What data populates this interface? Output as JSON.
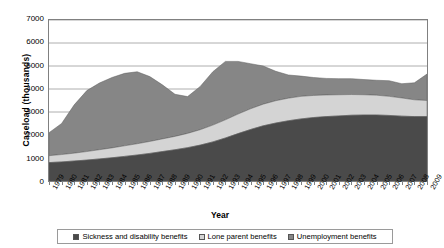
{
  "chart_data": {
    "type": "area",
    "stacked": true,
    "title": "",
    "xlabel": "Year",
    "ylabel": "Caseload (thousands)",
    "ylim": [
      0,
      7000
    ],
    "ytick_step": 1000,
    "yticks": [
      "7000",
      "6000",
      "5000",
      "4000",
      "3000",
      "2000",
      "1000",
      "0"
    ],
    "grid": true,
    "grid_axis": "y",
    "legend_position": "bottom",
    "categories": [
      "1979",
      "1980",
      "1981",
      "1982",
      "1983",
      "1984",
      "1985",
      "1986",
      "1987",
      "1988",
      "1989",
      "1990",
      "1991",
      "1992",
      "1993",
      "1994",
      "1995",
      "1996",
      "1997",
      "1998",
      "1999",
      "2000",
      "2001",
      "2002",
      "2003",
      "2004",
      "2005",
      "2006",
      "2007",
      "2008",
      "2009"
    ],
    "series": [
      {
        "name": "Sickness and disability benefits",
        "color": "#4a4a4a",
        "values": [
          800,
          830,
          870,
          910,
          960,
          1010,
          1070,
          1130,
          1200,
          1280,
          1360,
          1450,
          1560,
          1700,
          1870,
          2060,
          2240,
          2400,
          2520,
          2620,
          2700,
          2760,
          2800,
          2830,
          2860,
          2870,
          2870,
          2850,
          2820,
          2800,
          2800
        ]
      },
      {
        "name": "Lone parent benefits",
        "color": "#d4d4d4",
        "values": [
          300,
          320,
          340,
          370,
          400,
          430,
          460,
          490,
          520,
          550,
          580,
          620,
          670,
          730,
          790,
          850,
          900,
          940,
          970,
          980,
          980,
          960,
          940,
          920,
          900,
          880,
          860,
          830,
          790,
          730,
          700
        ]
      },
      {
        "name": "Unemployment benefits",
        "color": "#868686",
        "values": [
          1000,
          1350,
          2100,
          2650,
          2900,
          3060,
          3150,
          3130,
          2820,
          2350,
          1830,
          1600,
          1880,
          2320,
          2540,
          2290,
          1960,
          1660,
          1280,
          1010,
          880,
          780,
          720,
          700,
          690,
          660,
          650,
          680,
          620,
          740,
          1150
        ]
      }
    ]
  },
  "legend": {
    "items": [
      {
        "label": "Sickness and disability benefits"
      },
      {
        "label": "Lone parent benefits"
      },
      {
        "label": "Unemployment benefits"
      }
    ]
  }
}
